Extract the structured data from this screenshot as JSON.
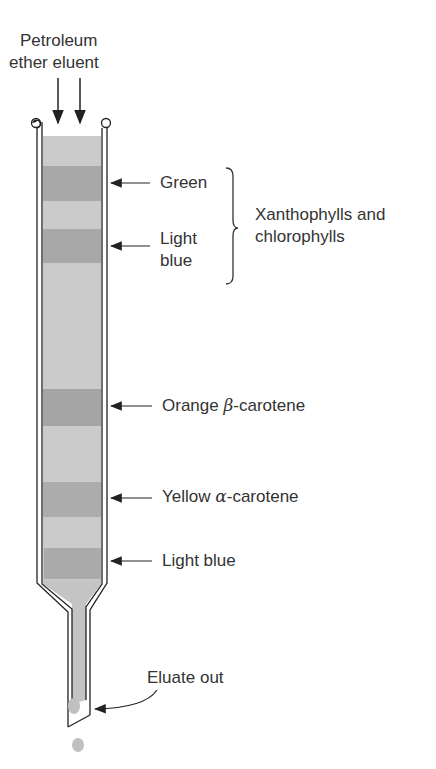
{
  "title_top": {
    "line1": "Petroleum",
    "line2": "ether eluent"
  },
  "bands": [
    {
      "label": "Green",
      "y": 183
    },
    {
      "label_line1": "Light",
      "label_line2": "blue",
      "y": 246
    },
    {
      "label_prefix": "Orange ",
      "greek": "β",
      "label_suffix": "-carotene",
      "y": 406
    },
    {
      "label_prefix": "Yellow ",
      "greek": "α",
      "label_suffix": "-carotene",
      "y": 496
    },
    {
      "label": "Light blue",
      "y": 561
    }
  ],
  "group_label": {
    "line1": "Xanthophylls and",
    "line2": "chlorophylls"
  },
  "eluate_label": "Eluate out",
  "colors": {
    "fill_light": "#c9c9c9",
    "fill_dark": "#a9a9a9",
    "wall": "#222222"
  }
}
